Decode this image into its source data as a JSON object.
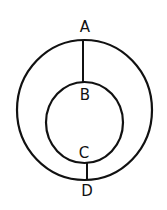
{
  "diagram": {
    "type": "concentric-circles",
    "stroke_color": "#111111",
    "background": "#ffffff",
    "outer_circle": {
      "cx": 84.5,
      "cy": 110,
      "rx": 67.5,
      "ry": 70
    },
    "inner_circle": {
      "cx": 84.5,
      "cy": 122.5,
      "rx": 38.5,
      "ry": 40.5
    },
    "segments": [
      {
        "name": "AB",
        "x1": 83,
        "y1": 40,
        "x2": 83,
        "y2": 82
      },
      {
        "name": "CD",
        "x1": 87,
        "y1": 163,
        "x2": 87,
        "y2": 180
      }
    ],
    "labels": [
      {
        "id": "A",
        "text": "A",
        "x": 85,
        "y": 32
      },
      {
        "id": "B",
        "text": "B",
        "x": 85,
        "y": 100
      },
      {
        "id": "C",
        "text": "C",
        "x": 84,
        "y": 158
      },
      {
        "id": "D",
        "text": "D",
        "x": 87,
        "y": 196
      }
    ]
  }
}
